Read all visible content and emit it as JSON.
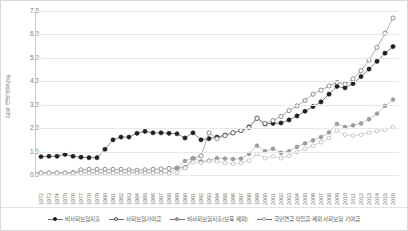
{
  "chart_data": {
    "type": "line",
    "title": "",
    "xlabel": "",
    "ylabel": "GDP 대비 비율 (%)",
    "ylim": [
      0.0,
      7.0
    ],
    "ytick_labels": [
      "0.0",
      "1.0",
      "2.0",
      "3.0",
      "4.0",
      "5.0",
      "6.0",
      "7.0"
    ],
    "ytick_values": [
      0.0,
      1.0,
      2.0,
      3.0,
      4.0,
      5.0,
      6.0,
      7.0
    ],
    "grid": true,
    "legend_position": "bottom",
    "categories": [
      1972,
      1973,
      1974,
      1975,
      1976,
      1977,
      1978,
      1979,
      1980,
      1981,
      1982,
      1983,
      1984,
      1985,
      1986,
      1987,
      1988,
      1989,
      1990,
      1991,
      1992,
      1993,
      1994,
      1995,
      1996,
      1997,
      1998,
      1999,
      2000,
      2001,
      2002,
      2003,
      2004,
      2005,
      2006,
      2007,
      2008,
      2009,
      2010,
      2011,
      2012,
      2013,
      2014,
      2015,
      2016
    ],
    "series": [
      {
        "name": "비사회보험지출",
        "marker": "filled-circle",
        "color": "#3c3c3c",
        "values": [
          0.78,
          0.8,
          0.8,
          0.88,
          0.8,
          0.76,
          0.74,
          0.74,
          1.1,
          1.5,
          1.62,
          1.62,
          1.78,
          1.86,
          1.8,
          1.8,
          1.78,
          1.76,
          1.58,
          1.8,
          1.5,
          1.55,
          1.62,
          1.7,
          1.8,
          1.9,
          2.05,
          2.42,
          2.18,
          2.2,
          2.22,
          2.35,
          2.52,
          2.72,
          2.92,
          3.12,
          3.45,
          3.78,
          3.72,
          3.9,
          4.2,
          4.52,
          4.85,
          5.2,
          5.48
        ]
      },
      {
        "name": "사회보험기여금",
        "marker": "open-circle",
        "color": "#5a5a5a",
        "values": [
          0.08,
          0.08,
          0.08,
          0.08,
          0.1,
          0.22,
          0.24,
          0.24,
          0.24,
          0.24,
          0.24,
          0.22,
          0.2,
          0.22,
          0.24,
          0.26,
          0.28,
          0.3,
          0.32,
          0.7,
          0.82,
          1.8,
          1.55,
          1.68,
          1.8,
          1.9,
          2.02,
          2.42,
          2.2,
          2.32,
          2.5,
          2.75,
          2.95,
          3.18,
          3.45,
          3.62,
          3.8,
          3.95,
          3.88,
          4.1,
          4.45,
          4.9,
          5.45,
          6.05,
          6.7
        ]
      },
      {
        "name": "비사회보험지출(보육 제외)",
        "marker": "gray-filled",
        "color": "#9e9e9e",
        "values": [
          0.1,
          0.1,
          0.1,
          0.1,
          0.1,
          0.1,
          0.1,
          0.1,
          0.1,
          0.1,
          0.1,
          0.1,
          0.1,
          0.1,
          0.1,
          0.1,
          0.1,
          0.28,
          0.6,
          0.72,
          0.58,
          0.62,
          0.72,
          0.7,
          0.68,
          0.7,
          0.9,
          1.25,
          1.02,
          1.12,
          0.95,
          1.02,
          1.2,
          1.35,
          1.48,
          1.62,
          1.82,
          2.18,
          2.05,
          2.12,
          2.2,
          2.38,
          2.62,
          2.95,
          3.22
        ]
      },
      {
        "name": "국민연금 적립금 제외 사회보험 기여금",
        "marker": "light-open",
        "color": "#b0b0b0",
        "values": [
          0.08,
          0.08,
          0.08,
          0.08,
          0.08,
          0.08,
          0.08,
          0.08,
          0.08,
          0.08,
          0.08,
          0.08,
          0.08,
          0.08,
          0.08,
          0.08,
          0.08,
          0.1,
          0.3,
          0.55,
          0.52,
          0.6,
          0.58,
          0.52,
          0.48,
          0.52,
          0.62,
          0.9,
          0.72,
          0.8,
          0.72,
          0.82,
          0.98,
          1.12,
          1.25,
          1.4,
          1.58,
          1.9,
          1.72,
          1.68,
          1.72,
          1.8,
          1.88,
          1.92,
          2.05
        ]
      }
    ]
  },
  "legend": {
    "items": [
      {
        "label": "비사회보험지출",
        "marker": "filled-circle"
      },
      {
        "label": "사회보험기여금",
        "marker": "open-circle"
      },
      {
        "label": "비사회보험지출(보육 제외)",
        "marker": "gray-filled"
      },
      {
        "label": "국민연금 적립금 제외 사회보험 기여금",
        "marker": "light-open"
      }
    ]
  }
}
